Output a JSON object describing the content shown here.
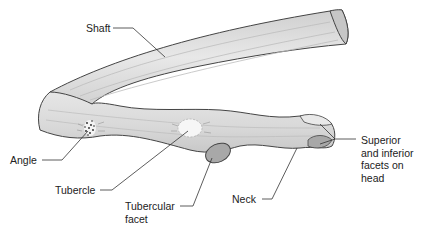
{
  "diagram": {
    "colors": {
      "bone_fill": "#dcdcdc",
      "bone_light": "#ebebeb",
      "bone_outline": "#444444",
      "facet_fill": "#a8a8a8",
      "leader_line": "#333333",
      "label_text": "#222222"
    },
    "labels": {
      "shaft": "Shaft",
      "angle": "Angle",
      "tubercle": "Tubercle",
      "tubercular_facet_line1": "Tubercular",
      "tubercular_facet_line2": "facet",
      "neck": "Neck",
      "head_facets_line1": "Superior",
      "head_facets_line2": "and inferior",
      "head_facets_line3": "facets on",
      "head_facets_line4": "head"
    }
  }
}
